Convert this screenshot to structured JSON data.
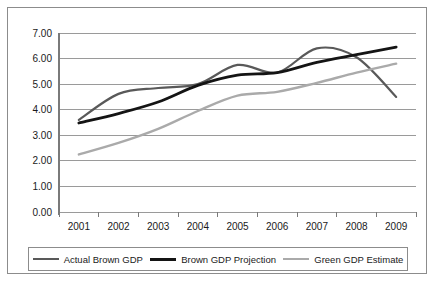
{
  "chart_data": {
    "type": "line",
    "title": "",
    "subtitle": "",
    "xlabel": "",
    "ylabel": "",
    "categories": [
      "2001",
      "2002",
      "2003",
      "2004",
      "2005",
      "2006",
      "2007",
      "2008",
      "2009"
    ],
    "x": [
      2001,
      2002,
      2003,
      2004,
      2005,
      2006,
      2007,
      2008,
      2009
    ],
    "ylim": [
      0.0,
      7.0
    ],
    "ytick_labels": [
      "0.00",
      "1.00",
      "2.00",
      "3.00",
      "4.00",
      "5.00",
      "6.00",
      "7.00"
    ],
    "ytick_values": [
      0,
      1,
      2,
      3,
      4,
      5,
      6,
      7
    ],
    "grid": "horizontal",
    "legend_position": "bottom",
    "series": [
      {
        "name": "Actual Brown GDP",
        "color": "#595959",
        "width": 2.2,
        "values": [
          3.6,
          4.62,
          4.85,
          5.0,
          5.75,
          5.45,
          6.4,
          6.05,
          4.5
        ]
      },
      {
        "name": "Brown GDP Projection",
        "color": "#141414",
        "width": 2.8,
        "values": [
          3.48,
          3.85,
          4.3,
          4.95,
          5.35,
          5.45,
          5.85,
          6.15,
          6.45
        ]
      },
      {
        "name": "Green GDP Estimate",
        "color": "#aaaaaa",
        "width": 2.4,
        "values": [
          2.25,
          2.7,
          3.25,
          3.95,
          4.55,
          4.7,
          5.05,
          5.45,
          5.8
        ]
      }
    ]
  },
  "legend": {
    "items": [
      {
        "label": "Actual Brown GDP",
        "color": "#595959",
        "width": 2.2
      },
      {
        "label": "Brown GDP Projection",
        "color": "#141414",
        "width": 3.0
      },
      {
        "label": "Green GDP Estimate",
        "color": "#aaaaaa",
        "width": 2.4
      }
    ]
  },
  "axes": {
    "axis_color": "#7a7a7a",
    "grid_color": "#9a9a9a",
    "tick_color": "#7a7a7a"
  }
}
